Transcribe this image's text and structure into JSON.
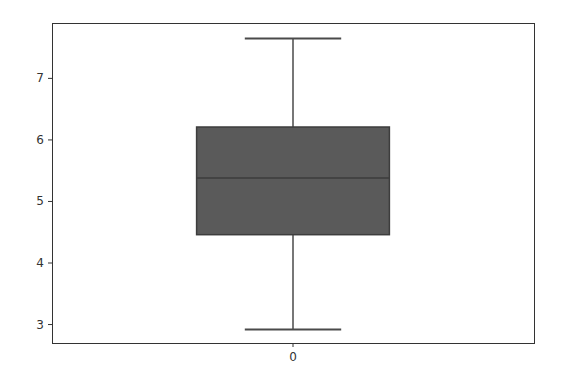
{
  "chart_data": {
    "type": "box",
    "title": "",
    "xlabel": "",
    "ylabel": "",
    "categories": [
      "0"
    ],
    "series": [
      {
        "name": "0",
        "whisker_low": 2.92,
        "q1": 4.46,
        "median": 5.38,
        "q3": 6.21,
        "whisker_high": 7.65
      }
    ],
    "yticks": [
      3,
      4,
      5,
      6,
      7
    ],
    "xticks": [
      "0"
    ],
    "ylim": [
      2.7,
      7.9
    ],
    "grid": false,
    "legend": null
  },
  "colors": {
    "box_fill": "#5a5a5a",
    "box_edge": "#3d3d3d",
    "median": "#3d3d3d",
    "whisker": "#4a4a4a",
    "axis": "#333333",
    "background": "#ffffff"
  },
  "layout": {
    "plot_left": 52,
    "plot_right": 534,
    "plot_top": 23,
    "plot_bottom": 343
  }
}
